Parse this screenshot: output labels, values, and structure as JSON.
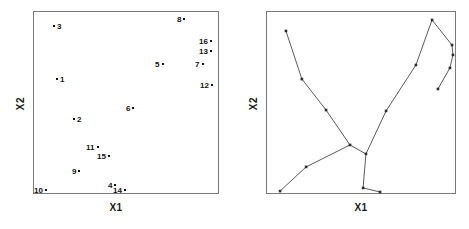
{
  "figure": {
    "panels": [
      {
        "id": "scatter",
        "type": "scatter",
        "axis_x_label": "X1",
        "axis_y_label": "X2"
      },
      {
        "id": "mst",
        "type": "network",
        "axis_x_label": "X1",
        "axis_y_label": "X2"
      }
    ]
  },
  "chart_data": [
    {
      "type": "scatter",
      "title": "",
      "xlabel": "X1",
      "ylabel": "X2",
      "xlim": [
        0,
        100
      ],
      "ylim": [
        0,
        100
      ],
      "grid": false,
      "legend": "none",
      "marker": "point",
      "labels_shown": true,
      "points": [
        {
          "label": "3",
          "x": 10.8,
          "y": 91.3,
          "label_side": "right"
        },
        {
          "label": "8",
          "x": 82.8,
          "y": 95.1,
          "label_side": "left"
        },
        {
          "label": "16",
          "x": 94.6,
          "y": 83.1,
          "label_side": "left"
        },
        {
          "label": "13",
          "x": 94.6,
          "y": 77.6,
          "label_side": "left"
        },
        {
          "label": "7",
          "x": 92.5,
          "y": 70.5,
          "label_side": "left"
        },
        {
          "label": "5",
          "x": 71.0,
          "y": 70.5,
          "label_side": "left"
        },
        {
          "label": "1",
          "x": 12.4,
          "y": 62.3,
          "label_side": "right"
        },
        {
          "label": "12",
          "x": 95.2,
          "y": 59.0,
          "label_side": "left"
        },
        {
          "label": "6",
          "x": 55.4,
          "y": 46.4,
          "label_side": "left"
        },
        {
          "label": "2",
          "x": 21.5,
          "y": 40.4,
          "label_side": "right"
        },
        {
          "label": "11",
          "x": 33.9,
          "y": 25.1,
          "label_side": "left"
        },
        {
          "label": "15",
          "x": 39.8,
          "y": 20.2,
          "label_side": "left"
        },
        {
          "label": "9",
          "x": 26.3,
          "y": 12.0,
          "label_side": "left"
        },
        {
          "label": "4",
          "x": 45.7,
          "y": 4.4,
          "label_side": "left"
        },
        {
          "label": "14",
          "x": 48.4,
          "y": 1.6,
          "label_side": "left"
        },
        {
          "label": "10",
          "x": 5.9,
          "y": 1.6,
          "label_side": "left"
        }
      ]
    },
    {
      "type": "network",
      "title": "",
      "xlabel": "X1",
      "ylabel": "X2",
      "xlim": [
        0,
        100
      ],
      "ylim": [
        0,
        100
      ],
      "grid": false,
      "legend": "none",
      "description": "minimum spanning tree connecting the sixteen observations",
      "nodes": [
        {
          "id": "n1",
          "x": 10.5,
          "y": 89.1
        },
        {
          "id": "n2",
          "x": 18.9,
          "y": 62.8
        },
        {
          "id": "n3",
          "x": 31.6,
          "y": 45.9
        },
        {
          "id": "n4",
          "x": 44.2,
          "y": 26.8
        },
        {
          "id": "n5",
          "x": 52.6,
          "y": 21.9
        },
        {
          "id": "n6",
          "x": 21.1,
          "y": 14.8
        },
        {
          "id": "n7",
          "x": 7.4,
          "y": 1.6
        },
        {
          "id": "n8",
          "x": 51.1,
          "y": 3.3
        },
        {
          "id": "n9",
          "x": 60.0,
          "y": 1.1
        },
        {
          "id": "n10",
          "x": 63.2,
          "y": 45.4
        },
        {
          "id": "n11",
          "x": 78.9,
          "y": 70.5
        },
        {
          "id": "n12",
          "x": 87.4,
          "y": 95.1
        },
        {
          "id": "n13",
          "x": 97.9,
          "y": 81.4
        },
        {
          "id": "n14",
          "x": 98.4,
          "y": 76.0
        },
        {
          "id": "n15",
          "x": 96.8,
          "y": 68.9
        },
        {
          "id": "n16",
          "x": 90.5,
          "y": 57.4
        }
      ],
      "edges": [
        [
          "n1",
          "n2"
        ],
        [
          "n2",
          "n3"
        ],
        [
          "n3",
          "n4"
        ],
        [
          "n4",
          "n5"
        ],
        [
          "n4",
          "n6"
        ],
        [
          "n6",
          "n7"
        ],
        [
          "n5",
          "n8"
        ],
        [
          "n8",
          "n9"
        ],
        [
          "n5",
          "n10"
        ],
        [
          "n10",
          "n11"
        ],
        [
          "n11",
          "n12"
        ],
        [
          "n12",
          "n13"
        ],
        [
          "n13",
          "n14"
        ],
        [
          "n14",
          "n15"
        ],
        [
          "n15",
          "n16"
        ]
      ]
    }
  ]
}
